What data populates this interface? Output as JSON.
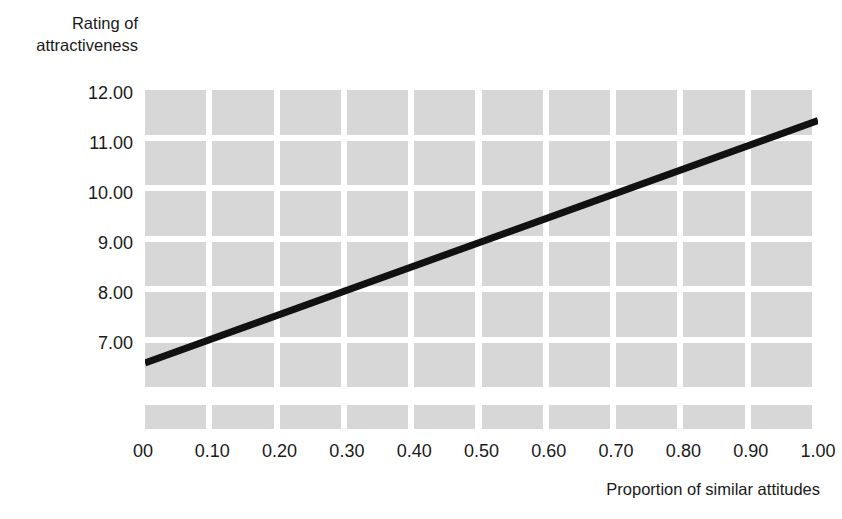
{
  "chart_data": {
    "type": "line",
    "title": "",
    "xlabel": "Proportion of similar attitudes",
    "ylabel": "Rating of\nattractiveness",
    "x_tick_labels": [
      "00",
      "0.10",
      "0.20",
      "0.30",
      "0.40",
      "0.50",
      "0.60",
      "0.70",
      "0.80",
      "0.90",
      "1.00"
    ],
    "x_tick_values": [
      0,
      0.1,
      0.2,
      0.3,
      0.4,
      0.5,
      0.6,
      0.7,
      0.8,
      0.9,
      1.0
    ],
    "y_tick_labels": [
      "12.00",
      "11.00",
      "10.00",
      "9.00",
      "8.00",
      "7.00"
    ],
    "y_tick_values": [
      12,
      11,
      10,
      9,
      8,
      7
    ],
    "xlim": [
      0,
      1.0
    ],
    "ylim": [
      6.0,
      12.06
    ],
    "grid": true,
    "grid_style": "shaded-blocks",
    "legend": "none",
    "series": [
      {
        "name": "Rating of attractiveness",
        "x": [
          0,
          1.0
        ],
        "values": [
          6.6,
          11.45
        ]
      }
    ],
    "line_color": "#111111",
    "line_width": 7,
    "grid_block_color": "#d7d7d7",
    "background_color": "#ffffff"
  },
  "axes": {
    "y_title": "Rating of\nattractiveness",
    "x_title": "Proportion of similar attitudes"
  }
}
